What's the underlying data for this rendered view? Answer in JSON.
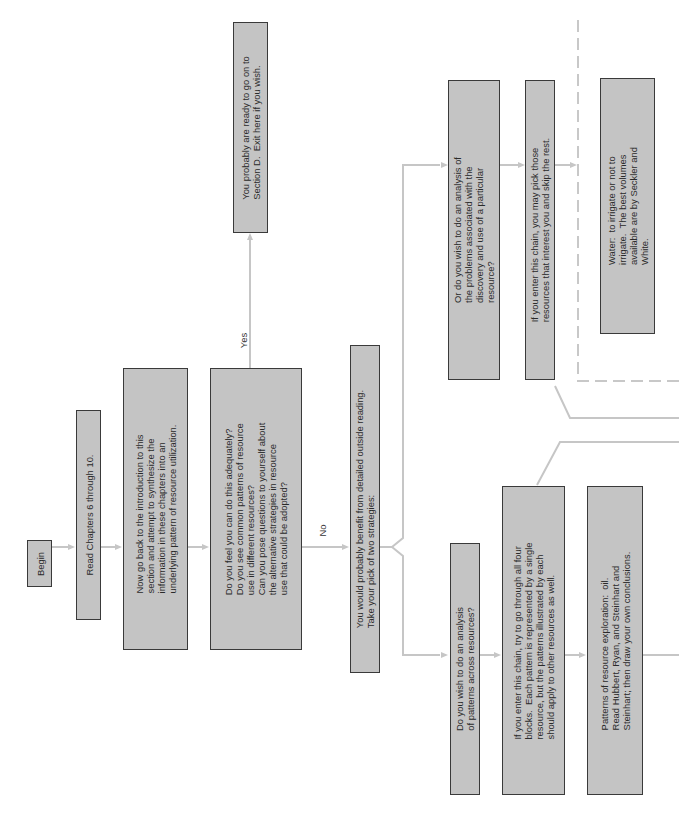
{
  "flowchart": {
    "begin": "Begin",
    "read_chapters": "Read Chapters 6 through 10.",
    "synthesize": "Now go back to the introduction to this\nsection and attempt to synthesize the\ninformation in these chapters into an\nunderlying pattern of resource utilization.",
    "self_check": "Do you feel you can do this adequately?\nDo you see common patterns of resource\nuse in different resources?\nCan you pose questions to yourself about\nthe alternative strategies in resource\nuse that could be adopted?",
    "yes_label": "Yes",
    "no_label": "No",
    "exit_section_d": "You probably are ready to go on to\nSection D.  Exit here if you wish.",
    "outside_reading": "You would probably benefit from detailed outside reading.\nTake your pick of two strategies:",
    "strategy_patterns": {
      "question": "Do you wish to do an analysis\nof patterns across resources?",
      "instruction": "If you enter this chain, try to go through all four\nblocks.  Each pattern is represented by a single\nresource, but the patterns illustrated by each\nshould apply to other resources as well.",
      "block_oil": "Patterns of resource exploration:  oil.\nRead Hubbert, Ryan, and Steinhart and\nSteinhart; then draw your own conclusions."
    },
    "strategy_problems": {
      "question": "Or do you wish to do an analysis of\nthe problems associated with the\ndiscovery and use of a particular\nresource?",
      "instruction": "If you enter this chain, you may pick those\nresources that interest you and skip the rest.",
      "block_water": "Water:  to irrigate or not to\nirrigate.  The best volumes\navailable are by Seckler and\nWhite."
    }
  },
  "colors": {
    "box_fill": "#c4c4c4",
    "box_border": "#3a3a3a",
    "connector": "#c6c6c6",
    "text": "#2a2a2a"
  }
}
